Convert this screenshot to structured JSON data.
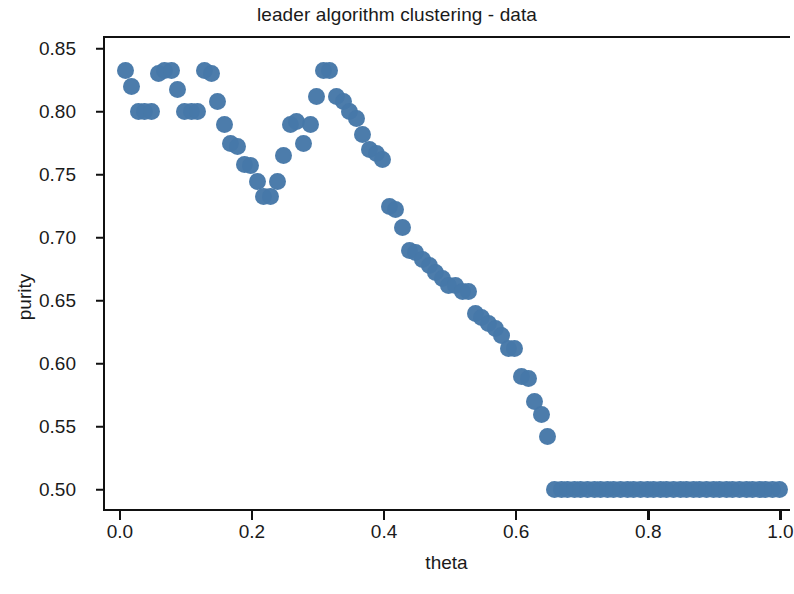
{
  "chart_data": {
    "type": "scatter",
    "title": "leader algorithm clustering - data",
    "xlabel": "theta",
    "ylabel": "purity",
    "xlim": [
      -0.0255,
      1.0145
    ],
    "ylim": [
      0.4815,
      0.8585
    ],
    "xticks": [
      "0.0",
      "0.2",
      "0.4",
      "0.6",
      "0.8",
      "1.0"
    ],
    "xtick_values": [
      0.0,
      0.2,
      0.4,
      0.6,
      0.8,
      1.0
    ],
    "yticks": [
      "0.50",
      "0.55",
      "0.60",
      "0.65",
      "0.70",
      "0.75",
      "0.80",
      "0.85"
    ],
    "ytick_values": [
      0.5,
      0.55,
      0.6,
      0.65,
      0.7,
      0.75,
      0.8,
      0.85
    ],
    "grid": false,
    "legend": null,
    "marker": {
      "shape": "circle",
      "color": "#4678a8",
      "size_px": 17
    },
    "series": [
      {
        "name": "purity vs theta",
        "x": [
          0.005,
          0.015,
          0.025,
          0.035,
          0.045,
          0.055,
          0.065,
          0.075,
          0.085,
          0.095,
          0.105,
          0.115,
          0.125,
          0.135,
          0.145,
          0.155,
          0.165,
          0.175,
          0.185,
          0.195,
          0.205,
          0.215,
          0.225,
          0.235,
          0.245,
          0.255,
          0.265,
          0.275,
          0.285,
          0.295,
          0.305,
          0.315,
          0.325,
          0.335,
          0.345,
          0.355,
          0.365,
          0.375,
          0.385,
          0.395,
          0.405,
          0.415,
          0.425,
          0.435,
          0.445,
          0.455,
          0.465,
          0.475,
          0.485,
          0.495,
          0.505,
          0.515,
          0.525,
          0.535,
          0.545,
          0.555,
          0.565,
          0.575,
          0.585,
          0.595,
          0.605,
          0.615,
          0.625,
          0.635,
          0.645,
          0.655,
          0.665,
          0.675,
          0.685,
          0.695,
          0.705,
          0.715,
          0.725,
          0.735,
          0.745,
          0.755,
          0.765,
          0.775,
          0.785,
          0.795,
          0.805,
          0.815,
          0.825,
          0.835,
          0.845,
          0.855,
          0.865,
          0.875,
          0.885,
          0.895,
          0.905,
          0.915,
          0.925,
          0.935,
          0.945,
          0.955,
          0.965,
          0.975,
          0.985,
          0.995
        ],
        "y": [
          0.833,
          0.82,
          0.8,
          0.8,
          0.8,
          0.83,
          0.833,
          0.833,
          0.818,
          0.8,
          0.8,
          0.8,
          0.833,
          0.83,
          0.808,
          0.79,
          0.775,
          0.772,
          0.758,
          0.757,
          0.745,
          0.733,
          0.733,
          0.745,
          0.765,
          0.79,
          0.792,
          0.775,
          0.79,
          0.812,
          0.833,
          0.833,
          0.812,
          0.808,
          0.8,
          0.795,
          0.782,
          0.77,
          0.767,
          0.762,
          0.725,
          0.722,
          0.708,
          0.69,
          0.688,
          0.683,
          0.678,
          0.672,
          0.668,
          0.662,
          0.662,
          0.657,
          0.657,
          0.64,
          0.637,
          0.632,
          0.628,
          0.622,
          0.612,
          0.612,
          0.59,
          0.588,
          0.57,
          0.56,
          0.542,
          0.5,
          0.5,
          0.5,
          0.5,
          0.5,
          0.5,
          0.5,
          0.5,
          0.5,
          0.5,
          0.5,
          0.5,
          0.5,
          0.5,
          0.5,
          0.5,
          0.5,
          0.5,
          0.5,
          0.5,
          0.5,
          0.5,
          0.5,
          0.5,
          0.5,
          0.5,
          0.5,
          0.5,
          0.5,
          0.5,
          0.5,
          0.5,
          0.5,
          0.5,
          0.5
        ]
      }
    ],
    "annotations": [
      "Purity starts near 0.83 at small theta, dips to a local minimum of about 0.733 near theta 0.22",
      "Recovers to a second peak of about 0.833 near theta 0.305-0.315",
      "Declines steadily to about 0.542 at theta 0.645",
      "Saturates at exactly 0.50 for theta from about 0.655 through 1.0"
    ]
  }
}
